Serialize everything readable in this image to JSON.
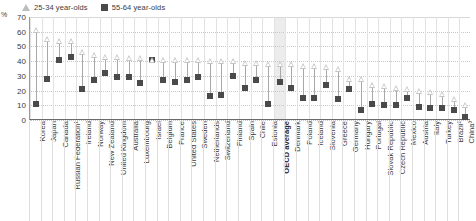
{
  "legend": {
    "position": "top-left",
    "entries": [
      {
        "label": "25-34 year-olds",
        "marker": "triangle-outline-icon",
        "color": "#c4c4c4"
      },
      {
        "label": "55-64 year-olds",
        "marker": "square-filled-icon",
        "color": "#4a4a4a"
      }
    ]
  },
  "axis": {
    "y_unit": "%",
    "y_ticks": [
      "0",
      "10",
      "20",
      "30",
      "40",
      "50",
      "60",
      "70"
    ]
  },
  "highlight": {
    "category": "OECD average",
    "color": "#ececec"
  },
  "chart_data": {
    "type": "scatter",
    "title": "",
    "subtitle": "",
    "xlabel": "",
    "ylabel": "%",
    "ylim": [
      0,
      70
    ],
    "grid": true,
    "legend_position": "top-left",
    "categories": [
      "Korea",
      "Japan",
      "Canada",
      "Russian Federation¹",
      "Ireland",
      "Norway",
      "New Zealand",
      "United Kingdom",
      "Australia",
      "Luxembourg",
      "Israel",
      "Belgium",
      "France",
      "United States",
      "Sweden",
      "Netherlands",
      "Switzerland",
      "Finland",
      "Spain",
      "Chile",
      "Estonia",
      "OECD average",
      "Denmark",
      "Poland",
      "Iceland",
      "Slovenia",
      "Greece",
      "Germany",
      "Hungary",
      "Portugal",
      "Slovak Republic",
      "Czech Republic",
      "Mexico",
      "Austria",
      "Italy",
      "Turkey",
      "Brazil²",
      "China³"
    ],
    "series": [
      {
        "name": "25-34 year-olds",
        "marker": "triangle",
        "color": "#c4c4c4",
        "values": [
          61,
          55,
          54,
          54,
          46,
          44,
          43,
          43,
          42,
          42,
          41,
          41,
          41,
          41,
          41,
          40,
          40,
          40,
          39,
          39,
          38,
          38,
          38,
          37,
          37,
          36,
          35,
          28,
          28,
          24,
          23,
          22,
          21,
          20,
          19,
          18,
          14,
          10
        ]
      },
      {
        "name": "55-64 year-olds",
        "marker": "square",
        "color": "#4a4a4a",
        "values": [
          11,
          28,
          41,
          43,
          21,
          27,
          32,
          29,
          29,
          25,
          41,
          27,
          26,
          27,
          29,
          16,
          17,
          30,
          22,
          27,
          11,
          26,
          22,
          15,
          15,
          24,
          14,
          21,
          7,
          11,
          10,
          10,
          15,
          9,
          8,
          8,
          7,
          2
        ]
      }
    ]
  }
}
